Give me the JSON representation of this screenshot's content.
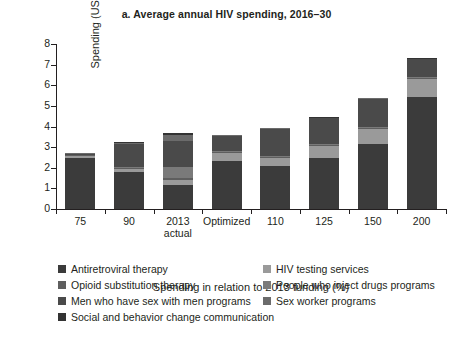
{
  "chart_data": {
    "type": "bar",
    "stacked": true,
    "title": "a. Average annual HIV spending, 2016–30",
    "xlabel": "Spending in relation to 2013 funding (%)",
    "ylabel": "Spending (US$, millions)",
    "ylim": [
      0,
      8
    ],
    "yticks": [
      0,
      1,
      2,
      3,
      4,
      5,
      6,
      7,
      8
    ],
    "grid": false,
    "legend_position": "bottom",
    "categories": [
      "75",
      "90",
      "2013\nactual",
      "Optimized",
      "110",
      "125",
      "150",
      "200"
    ],
    "category_labels": [
      {
        "line1": "75",
        "line2": ""
      },
      {
        "line1": "90",
        "line2": ""
      },
      {
        "line1": "2013",
        "line2": "actual"
      },
      {
        "line1": "Optimized",
        "line2": ""
      },
      {
        "line1": "110",
        "line2": ""
      },
      {
        "line1": "125",
        "line2": ""
      },
      {
        "line1": "150",
        "line2": ""
      },
      {
        "line1": "200",
        "line2": ""
      }
    ],
    "series": [
      {
        "name": "Antiretroviral therapy",
        "color": "#3b3b3b",
        "values": [
          2.45,
          1.8,
          1.15,
          2.35,
          2.1,
          2.45,
          3.15,
          5.45
        ]
      },
      {
        "name": "HIV testing services",
        "color": "#9a9a9a",
        "values": [
          0.1,
          0.15,
          0.25,
          0.35,
          0.35,
          0.6,
          0.75,
          0.85
        ]
      },
      {
        "name": "Opioid substitution therapy",
        "color": "#5e5e5e",
        "values": [
          0.05,
          0.05,
          0.1,
          0.05,
          0.05,
          0.05,
          0.05,
          0.05
        ]
      },
      {
        "name": "People who inject drugs programs",
        "color": "#7a7a7a",
        "values": [
          0.03,
          0.05,
          0.55,
          0.05,
          0.05,
          0.05,
          0.05,
          0.05
        ]
      },
      {
        "name": "Men who have sex with men programs",
        "color": "#4a4a4a",
        "values": [
          0.05,
          1.1,
          1.25,
          0.75,
          1.35,
          1.25,
          1.35,
          0.85
        ]
      },
      {
        "name": "Sex worker programs",
        "color": "#6b6b6b",
        "values": [
          0.02,
          0.05,
          0.3,
          0.03,
          0.03,
          0.03,
          0.03,
          0.03
        ]
      },
      {
        "name": "Social and behavior change communication",
        "color": "#333333",
        "values": [
          0.0,
          0.05,
          0.1,
          0.02,
          0.02,
          0.02,
          0.02,
          0.02
        ]
      }
    ],
    "totals": [
      2.7,
      3.25,
      3.7,
      3.6,
      3.95,
      4.45,
      5.4,
      7.3
    ]
  },
  "legend": {
    "rows": [
      [
        "Antiretroviral therapy",
        "HIV testing services"
      ],
      [
        "Opioid substitution therapy",
        "People who inject drugs programs"
      ],
      [
        "Men who have sex with men programs",
        "Sex worker programs"
      ],
      [
        "Social and behavior change communication",
        ""
      ]
    ]
  },
  "colors": {
    "axis": "#231f20",
    "text": "#231f20",
    "background": "#ffffff"
  }
}
